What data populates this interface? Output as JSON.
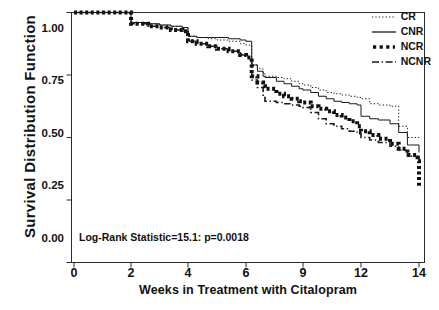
{
  "chart_data": {
    "type": "line",
    "subtype": "kaplan-meier-survival",
    "title": "",
    "xlabel": "Weeks in Treatment with Citalopram",
    "ylabel": "Survival Distribution Function",
    "xlim": [
      0,
      14
    ],
    "ylim": [
      0,
      1
    ],
    "xticks": [
      0,
      2,
      4,
      6,
      9,
      12,
      14
    ],
    "xtick_labels": [
      "0",
      "2",
      "4",
      "6",
      "9",
      "12",
      "14"
    ],
    "yticks": [
      0.0,
      0.25,
      0.5,
      0.75,
      1.0
    ],
    "ytick_labels": [
      "0.00",
      "0.25",
      "0.50",
      "0.75",
      "1.00"
    ],
    "grid": false,
    "legend_position": "top-right",
    "annotation": "Log-Rank Statistic=15.1: p=0.0018",
    "series": [
      {
        "name": "CR",
        "linestyle": "dotted",
        "color": "#1a1a1a",
        "linewidth": 1,
        "x": [
          0,
          1.9,
          2.0,
          2.6,
          3.0,
          3.4,
          3.8,
          4.0,
          4.3,
          4.7,
          5.0,
          5.4,
          5.8,
          6.0,
          6.3,
          6.6,
          6.9,
          7.0,
          7.6,
          8.0,
          8.4,
          8.8,
          9.0,
          9.4,
          9.8,
          10.2,
          10.6,
          11.0,
          11.4,
          11.8,
          12.0,
          12.3,
          12.6,
          13.0,
          13.3,
          13.6,
          14.0
        ],
        "y": [
          1.0,
          1.0,
          0.96,
          0.955,
          0.95,
          0.945,
          0.94,
          0.905,
          0.9,
          0.895,
          0.89,
          0.885,
          0.875,
          0.87,
          0.79,
          0.775,
          0.755,
          0.745,
          0.74,
          0.735,
          0.725,
          0.715,
          0.71,
          0.7,
          0.69,
          0.68,
          0.675,
          0.67,
          0.665,
          0.66,
          0.655,
          0.635,
          0.63,
          0.625,
          0.545,
          0.5,
          0.49
        ]
      },
      {
        "name": "CNR",
        "linestyle": "solid",
        "color": "#1a1a1a",
        "linewidth": 1,
        "x": [
          0,
          1.9,
          2.0,
          2.6,
          3.0,
          3.4,
          3.8,
          4.0,
          4.3,
          4.7,
          5.0,
          5.4,
          5.8,
          6.0,
          6.3,
          6.6,
          6.9,
          7.0,
          7.6,
          8.0,
          8.4,
          8.8,
          9.0,
          9.4,
          9.8,
          10.2,
          10.6,
          11.0,
          11.4,
          11.8,
          12.0,
          12.3,
          12.6,
          13.0,
          13.3,
          13.6,
          14.0
        ],
        "y": [
          1.0,
          1.0,
          0.96,
          0.955,
          0.95,
          0.945,
          0.94,
          0.905,
          0.9,
          0.9,
          0.9,
          0.895,
          0.89,
          0.885,
          0.79,
          0.765,
          0.745,
          0.74,
          0.725,
          0.715,
          0.705,
          0.695,
          0.69,
          0.68,
          0.665,
          0.655,
          0.645,
          0.64,
          0.635,
          0.63,
          0.585,
          0.575,
          0.57,
          0.555,
          0.52,
          0.47,
          0.44
        ]
      },
      {
        "name": "NCR",
        "linestyle": "thick-dotted",
        "color": "#101010",
        "linewidth": 4,
        "x": [
          0,
          1.9,
          2.0,
          2.6,
          3.0,
          3.4,
          3.8,
          4.0,
          4.3,
          4.7,
          5.0,
          5.4,
          5.8,
          6.0,
          6.3,
          6.6,
          6.9,
          7.0,
          7.6,
          8.0,
          8.4,
          8.8,
          9.0,
          9.4,
          9.8,
          10.2,
          10.6,
          11.0,
          11.4,
          11.8,
          12.0,
          12.3,
          12.6,
          13.0,
          13.3,
          13.6,
          13.95,
          14.0
        ],
        "y": [
          1.0,
          1.0,
          0.955,
          0.945,
          0.94,
          0.93,
          0.925,
          0.885,
          0.875,
          0.865,
          0.855,
          0.845,
          0.83,
          0.82,
          0.745,
          0.72,
          0.705,
          0.695,
          0.675,
          0.665,
          0.655,
          0.645,
          0.64,
          0.625,
          0.615,
          0.605,
          0.59,
          0.58,
          0.565,
          0.545,
          0.525,
          0.51,
          0.495,
          0.475,
          0.455,
          0.43,
          0.405,
          0.3
        ]
      },
      {
        "name": "NCNR",
        "linestyle": "dash-dot",
        "color": "#1a1a1a",
        "linewidth": 1.6,
        "x": [
          0,
          1.9,
          2.0,
          2.6,
          3.0,
          3.4,
          3.8,
          4.0,
          4.3,
          4.7,
          5.0,
          5.4,
          5.8,
          6.0,
          6.3,
          6.6,
          6.9,
          7.0,
          7.6,
          8.0,
          8.4,
          8.8,
          9.0,
          9.4,
          9.8,
          10.2,
          10.6,
          11.0,
          11.4,
          11.8,
          12.0,
          12.3,
          12.6,
          13.0,
          13.3,
          13.6,
          14.0
        ],
        "y": [
          1.0,
          1.0,
          0.955,
          0.945,
          0.94,
          0.93,
          0.925,
          0.885,
          0.875,
          0.865,
          0.855,
          0.845,
          0.83,
          0.82,
          0.73,
          0.7,
          0.66,
          0.645,
          0.64,
          0.635,
          0.63,
          0.625,
          0.62,
          0.6,
          0.575,
          0.555,
          0.545,
          0.535,
          0.525,
          0.515,
          0.5,
          0.49,
          0.48,
          0.465,
          0.45,
          0.425,
          0.39
        ]
      }
    ]
  },
  "legend": {
    "entries": [
      {
        "label": "CR"
      },
      {
        "label": "CNR"
      },
      {
        "label": "NCR"
      },
      {
        "label": "NCNR"
      }
    ]
  }
}
